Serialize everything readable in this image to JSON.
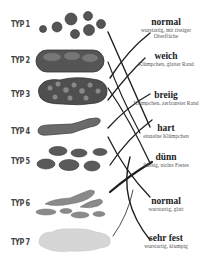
{
  "types": [
    {
      "label": "TYP 1",
      "y": 22
    },
    {
      "label": "TYP 2",
      "y": 56
    },
    {
      "label": "TYP 3",
      "y": 92
    },
    {
      "label": "TYP 4",
      "y": 127
    },
    {
      "label": "TYP 5",
      "y": 156
    },
    {
      "label": "TYP 6",
      "y": 198
    },
    {
      "label": "TYP 7",
      "y": 238
    }
  ],
  "descriptions": [
    {
      "title": "normal",
      "sub": "wurstartig, mit rissiger Oberfläche",
      "y": 17
    },
    {
      "title": "weich",
      "sub": "Klümpchen, glatter Rand",
      "y": 50
    },
    {
      "title": "breiig",
      "sub": "Klümpchen, zerfranster Rand",
      "y": 90
    },
    {
      "title": "hart",
      "sub": "einzelne Klümpchen",
      "y": 122
    },
    {
      "title": "dünn",
      "sub": "flüssig, nichts Festes",
      "y": 151
    },
    {
      "title": "normal",
      "sub": "wurstartig, glatt",
      "y": 194
    },
    {
      "title": "sehr fest",
      "sub": "wurstartig, klumpig",
      "y": 232
    }
  ],
  "colors": {
    "stool_dark": "#4a4a4a",
    "stool_mid": "#7a7a7a",
    "stool_light": "#b5b5b5",
    "stool_pale": "#d8d8d8",
    "line": "#1e1e1e"
  }
}
